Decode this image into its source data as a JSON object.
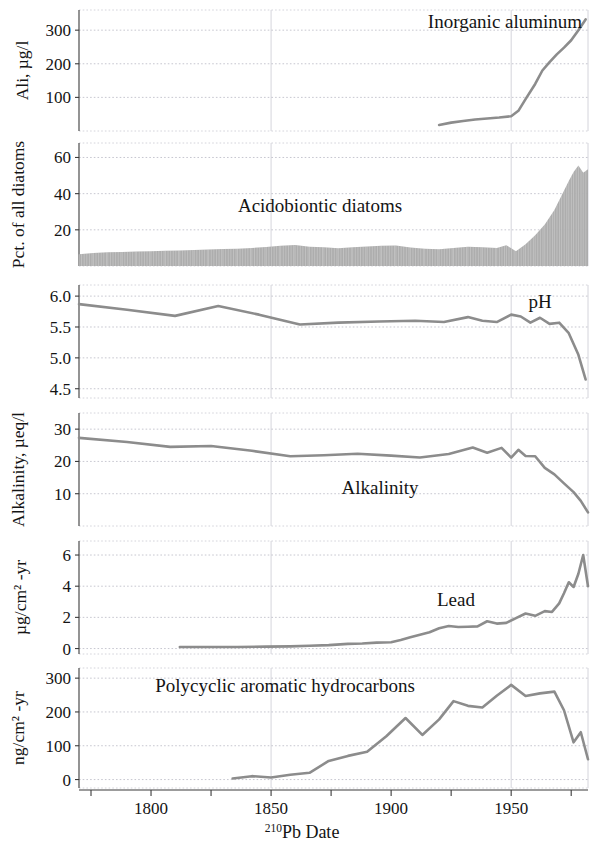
{
  "figure": {
    "xaxis": {
      "title_sup": "210",
      "title_main": "Pb Date",
      "ticks": [
        1800,
        1850,
        1900,
        1950
      ],
      "tick_labels": [
        "1800",
        "1850",
        "1900",
        "1950"
      ],
      "minor_ticks": [
        1775,
        1825,
        1875,
        1925,
        1975
      ],
      "range": [
        1770,
        1982
      ],
      "gridlines": [
        1850,
        1950
      ]
    },
    "line_color": "#8c8c8c",
    "area_color": "#a9a9a9"
  },
  "chart_data": [
    {
      "type": "line",
      "panel": 1,
      "title": "Inorganic aluminum",
      "ylabel": "Ali, µg/l",
      "ylim": [
        0,
        360
      ],
      "yticks": [
        100,
        200,
        300
      ],
      "ytick_labels": [
        "100",
        "200",
        "300"
      ],
      "xlabel": "",
      "x": [
        1920,
        1925,
        1930,
        1935,
        1940,
        1945,
        1950,
        1953,
        1956,
        1960,
        1963,
        1966,
        1969,
        1972,
        1975,
        1978,
        1981
      ],
      "values": [
        18,
        25,
        30,
        34,
        37,
        40,
        44,
        60,
        95,
        140,
        180,
        205,
        228,
        248,
        270,
        300,
        332
      ]
    },
    {
      "type": "area",
      "panel": 2,
      "title": "Acidobiontic diatoms",
      "ylabel": "Pct. of all diatoms",
      "ylim": [
        0,
        68
      ],
      "yticks": [
        20,
        40,
        60
      ],
      "ytick_labels": [
        "20",
        "40",
        "60"
      ],
      "xlabel": "",
      "x": [
        1770,
        1776,
        1782,
        1788,
        1794,
        1800,
        1806,
        1812,
        1818,
        1824,
        1830,
        1836,
        1842,
        1848,
        1854,
        1860,
        1866,
        1872,
        1878,
        1884,
        1890,
        1896,
        1902,
        1908,
        1914,
        1920,
        1926,
        1932,
        1938,
        1944,
        1948,
        1952,
        1956,
        1960,
        1964,
        1968,
        1971,
        1974,
        1976,
        1978,
        1980,
        1982
      ],
      "values": [
        6.5,
        7.2,
        7.6,
        7.8,
        8.0,
        8.2,
        8.4,
        8.6,
        8.8,
        9.1,
        9.4,
        9.6,
        10.0,
        10.5,
        11.2,
        11.6,
        10.7,
        10.4,
        9.8,
        10.4,
        10.8,
        11.2,
        11.4,
        10.2,
        9.5,
        9.3,
        10.0,
        10.6,
        10.3,
        10.0,
        11.5,
        8.2,
        12.0,
        17.0,
        23.0,
        31.0,
        39.0,
        47.0,
        52.0,
        55.5,
        51.5,
        53.5
      ]
    },
    {
      "type": "line",
      "panel": 3,
      "title": "pH",
      "ylabel": "",
      "ylim": [
        4.35,
        6.18
      ],
      "yticks": [
        4.5,
        5.0,
        5.5,
        6.0
      ],
      "ytick_labels": [
        "4.5",
        "5.0",
        "5.5",
        "6.0"
      ],
      "xlabel": "",
      "x": [
        1770,
        1790,
        1810,
        1828,
        1845,
        1862,
        1878,
        1895,
        1910,
        1922,
        1932,
        1938,
        1944,
        1950,
        1954,
        1958,
        1962,
        1966,
        1970,
        1974,
        1978,
        1981
      ],
      "values": [
        5.87,
        5.78,
        5.68,
        5.84,
        5.7,
        5.54,
        5.57,
        5.59,
        5.6,
        5.58,
        5.66,
        5.6,
        5.58,
        5.7,
        5.67,
        5.57,
        5.65,
        5.55,
        5.57,
        5.4,
        5.05,
        4.65
      ]
    },
    {
      "type": "line",
      "panel": 4,
      "title": "Alkalinity",
      "ylabel": "Alkalinity, µeq/l",
      "ylim": [
        0,
        35
      ],
      "yticks": [
        10,
        20,
        30
      ],
      "ytick_labels": [
        "10",
        "20",
        "30"
      ],
      "xlabel": "",
      "x": [
        1770,
        1790,
        1808,
        1825,
        1842,
        1858,
        1872,
        1886,
        1900,
        1912,
        1924,
        1934,
        1940,
        1946,
        1950,
        1953,
        1956,
        1960,
        1964,
        1968,
        1972,
        1976,
        1979,
        1982
      ],
      "values": [
        27.3,
        26.0,
        24.5,
        24.8,
        23.3,
        21.6,
        21.9,
        22.4,
        21.8,
        21.2,
        22.3,
        24.3,
        22.7,
        24.2,
        21.2,
        23.6,
        21.7,
        21.6,
        18.0,
        16.0,
        13.2,
        10.5,
        7.8,
        4.2
      ]
    },
    {
      "type": "line",
      "panel": 5,
      "title": "Lead",
      "ylabel": "µg/cm² -yr",
      "ylim": [
        -0.35,
        6.9
      ],
      "yticks": [
        0,
        2,
        4,
        6
      ],
      "ytick_labels": [
        "0",
        "2",
        "4",
        "6"
      ],
      "xlabel": "",
      "x": [
        1812,
        1824,
        1836,
        1848,
        1858,
        1866,
        1874,
        1882,
        1888,
        1894,
        1900,
        1904,
        1908,
        1912,
        1916,
        1920,
        1924,
        1928,
        1932,
        1936,
        1940,
        1944,
        1948,
        1952,
        1956,
        1960,
        1964,
        1967,
        1970,
        1972,
        1974,
        1976,
        1978,
        1980,
        1982
      ],
      "values": [
        0.1,
        0.1,
        0.1,
        0.12,
        0.14,
        0.18,
        0.22,
        0.3,
        0.32,
        0.38,
        0.4,
        0.55,
        0.72,
        0.88,
        1.05,
        1.3,
        1.45,
        1.38,
        1.4,
        1.42,
        1.75,
        1.6,
        1.65,
        1.95,
        2.25,
        2.1,
        2.4,
        2.35,
        2.9,
        3.55,
        4.25,
        3.95,
        4.8,
        6.0,
        4.0,
        5.2
      ]
    },
    {
      "type": "line",
      "panel": 6,
      "title": "Polycyclic aromatic hydrocarbons",
      "ylabel": "ng/cm² -yr",
      "ylim": [
        -25,
        330
      ],
      "yticks": [
        0,
        100,
        200,
        300
      ],
      "ytick_labels": [
        "0",
        "100",
        "200",
        "300"
      ],
      "xlabel": "",
      "x": [
        1834,
        1842,
        1850,
        1858,
        1866,
        1874,
        1882,
        1890,
        1898,
        1906,
        1913,
        1920,
        1926,
        1932,
        1938,
        1944,
        1950,
        1956,
        1962,
        1968,
        1972,
        1976,
        1979,
        1982
      ],
      "values": [
        3,
        10,
        6,
        14,
        20,
        55,
        70,
        82,
        128,
        182,
        132,
        178,
        232,
        218,
        213,
        248,
        280,
        247,
        255,
        260,
        205,
        110,
        140,
        60
      ]
    }
  ]
}
